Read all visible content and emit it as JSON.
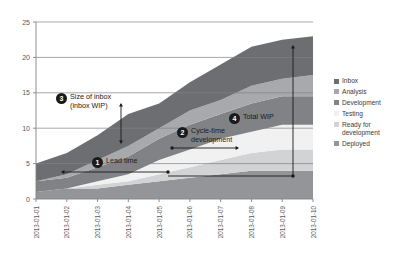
{
  "chart_data": {
    "type": "area",
    "stacked": true,
    "title": "",
    "xlabel": "",
    "ylabel": "",
    "ylim": [
      0,
      25
    ],
    "yticks": [
      0,
      5,
      10,
      15,
      20,
      25
    ],
    "grid": true,
    "legend_position": "right",
    "categories": [
      "2013-01-01",
      "2013-01-02",
      "2013-01-03",
      "2013-01-04",
      "2013-01-05",
      "2013-01-06",
      "2013-01-07",
      "2013-01-08",
      "2013-01-09",
      "2013-01-10"
    ],
    "series": [
      {
        "name": "Inbox",
        "color": "#6d6e71",
        "values": [
          2.5,
          3.0,
          3.5,
          4.5,
          3.5,
          4.0,
          5.0,
          5.5,
          5.5,
          5.5
        ]
      },
      {
        "name": "Analysis",
        "color": "#a7a9ac",
        "values": [
          0.0,
          0.5,
          1.0,
          1.5,
          1.5,
          2.0,
          2.0,
          2.5,
          2.5,
          3.0
        ]
      },
      {
        "name": "Development",
        "color": "#808285",
        "values": [
          1.5,
          1.5,
          2.0,
          2.5,
          3.0,
          3.5,
          3.5,
          4.0,
          4.0,
          4.0
        ]
      },
      {
        "name": "Testing",
        "color": "#f1f1f2",
        "values": [
          0.0,
          0.0,
          0.5,
          1.0,
          2.0,
          2.5,
          3.0,
          3.0,
          3.5,
          3.5
        ]
      },
      {
        "name": "Ready for development",
        "color": "#d1d3d4",
        "values": [
          0.0,
          0.0,
          0.5,
          0.5,
          1.0,
          1.5,
          2.0,
          2.5,
          3.0,
          3.0
        ]
      },
      {
        "name": "Deployed",
        "color": "#939598",
        "values": [
          1.0,
          1.5,
          1.5,
          2.0,
          2.5,
          3.0,
          3.5,
          4.0,
          4.0,
          4.0
        ]
      }
    ],
    "totals": [
      5.0,
      6.5,
      9.0,
      12.0,
      13.5,
      16.5,
      19.0,
      21.5,
      22.5,
      23.0
    ],
    "annotations": [
      {
        "id": "1",
        "number": "1",
        "label": "Lead time"
      },
      {
        "id": "2",
        "number": "2",
        "label": "Cycle-time\ndevelopment"
      },
      {
        "id": "3",
        "number": "3",
        "label": "Size of inbox\n(inbox WIP)"
      },
      {
        "id": "4",
        "number": "4",
        "label": "Total WIP"
      }
    ]
  },
  "legend": {
    "items": [
      {
        "label": "Inbox",
        "color": "#6d6e71"
      },
      {
        "label": "Analysis",
        "color": "#a7a9ac"
      },
      {
        "label": "Development",
        "color": "#808285"
      },
      {
        "label": "Testing",
        "color": "#f1f1f2"
      },
      {
        "label": "Ready for development",
        "color": "#d1d3d4"
      },
      {
        "label": "Deployed",
        "color": "#939598"
      }
    ]
  },
  "axes": {
    "y_labels": [
      "25",
      "20",
      "15",
      "10",
      "5",
      "0"
    ],
    "x_labels": [
      "2013-01-01",
      "2013-01-02",
      "2013-01-03",
      "2013-01-04",
      "2013-01-05",
      "2013-01-06",
      "2013-01-07",
      "2013-01-08",
      "2013-01-09",
      "2013-01-10"
    ]
  },
  "colors": {
    "axis": "#808285",
    "grid": "#808285",
    "annotation": "#1a1a1a",
    "background": "#ffffff"
  }
}
